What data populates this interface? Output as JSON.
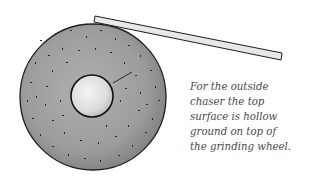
{
  "figure": {
    "type": "illustration",
    "colors": {
      "wheel_fill": "#9a9a9a",
      "wheel_outline": "#1e1e1e",
      "hub_fill": "#e6e6e6",
      "bar_fill": "#e8e8e8",
      "speckle": "#2a2a2a"
    }
  },
  "caption": {
    "lines": [
      "For the outside",
      "chaser the top",
      "surface is hollow",
      "ground on top of",
      "the grinding wheel."
    ]
  }
}
